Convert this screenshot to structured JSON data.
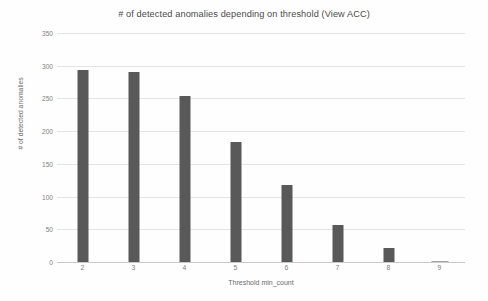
{
  "chart_data": {
    "type": "bar",
    "title": "# of detected anomalies depending on threshold (View ACC)",
    "xlabel": "Threshold min_count",
    "ylabel": "# of detected anomalies",
    "categories": [
      "2",
      "3",
      "4",
      "5",
      "6",
      "7",
      "8",
      "9"
    ],
    "values": [
      293,
      290,
      254,
      184,
      117,
      56,
      22,
      1
    ],
    "ylim": [
      0,
      350
    ],
    "yticks": [
      0,
      50,
      100,
      150,
      200,
      250,
      300,
      350
    ],
    "ytick_labels": [
      "0",
      "50",
      "100",
      "150",
      "200",
      "250",
      "300",
      "350"
    ],
    "grid": true,
    "legend": false,
    "bar_color": "#595959",
    "gridline_color": "#e4e4e4",
    "axis_text_color": "#7f7f7f",
    "annotations": [
      {
        "name": "highlight-region",
        "type": "rectangle",
        "covers_categories": [
          "8",
          "9"
        ],
        "fill_color": "#f2f2f2",
        "border_color": "#a6a6a6"
      }
    ]
  }
}
